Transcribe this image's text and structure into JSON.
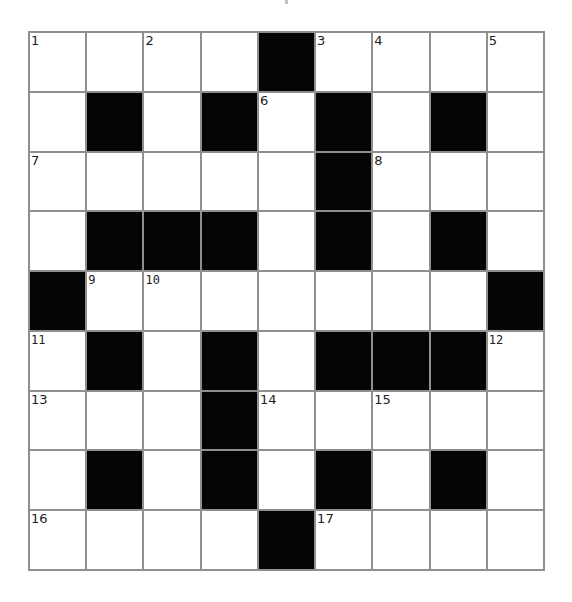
{
  "puzzle": {
    "rows": 9,
    "cols": 9,
    "colors": {
      "block": "#050505",
      "cell": "#ffffff",
      "gridline": "#8f8f8f",
      "number": "#222222"
    },
    "grid": [
      [
        "1",
        "",
        "2",
        "",
        "#",
        "3",
        "4",
        "",
        "5"
      ],
      [
        "",
        "#",
        "",
        "#",
        "6",
        "#",
        "",
        "#",
        ""
      ],
      [
        "7",
        "",
        "",
        "",
        "",
        "#",
        "8",
        "",
        ""
      ],
      [
        "",
        "#",
        "#",
        "#",
        "",
        "#",
        "",
        "#",
        ""
      ],
      [
        "#",
        "9",
        "10",
        "",
        "",
        "",
        "",
        "",
        "#"
      ],
      [
        "11",
        "#",
        "",
        "#",
        "",
        "#",
        "#",
        "#",
        "12"
      ],
      [
        "13",
        "",
        "",
        "#",
        "14",
        "",
        "15",
        "",
        ""
      ],
      [
        "",
        "#",
        "",
        "#",
        "",
        "#",
        "",
        "#",
        ""
      ],
      [
        "16",
        "",
        "",
        "",
        "#",
        "17",
        "",
        "",
        ""
      ]
    ],
    "mono_numbers": [
      "9",
      "10",
      "11",
      "12"
    ]
  }
}
